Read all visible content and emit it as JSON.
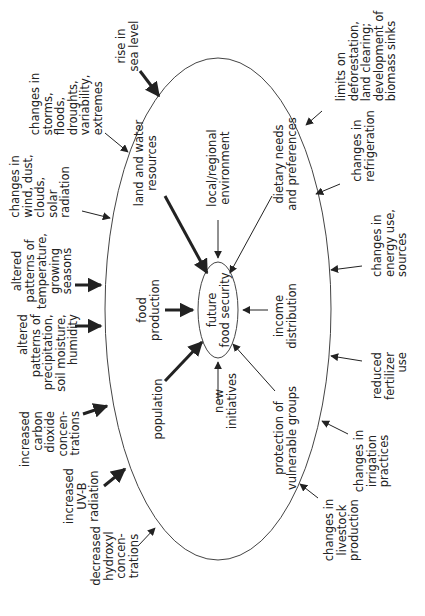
{
  "diagram": {
    "center": {
      "text": "future\nfood security"
    },
    "colors": {
      "line": "#333333",
      "text": "#222222",
      "background": "#ffffff"
    },
    "inner_factors": [
      {
        "id": "land-water",
        "text": "land and water\nresources",
        "arrow": "thick"
      },
      {
        "id": "local-env",
        "text": "local/regional\nenvironment",
        "arrow": "thin"
      },
      {
        "id": "dietary",
        "text": "dietary needs\nand preferences",
        "arrow": "thin"
      },
      {
        "id": "food-production",
        "text": "food\nproduction",
        "arrow": "thick"
      },
      {
        "id": "income",
        "text": "income\ndistribution",
        "arrow": "thin"
      },
      {
        "id": "population",
        "text": "population",
        "arrow": "thick"
      },
      {
        "id": "new-initiatives",
        "text": "new\ninitiatives",
        "arrow": "thin"
      },
      {
        "id": "vulnerable",
        "text": "protection of\nvulnerable groups",
        "arrow": "thin"
      }
    ],
    "outer_left": [
      {
        "id": "sea-level",
        "text": "rise in\nsea level",
        "arrow": "thick"
      },
      {
        "id": "storms",
        "text": "changes in\nstorms,\nfloods,\ndroughts,\nvariability,\nextremes",
        "arrow": "thin"
      },
      {
        "id": "wind",
        "text": "changes in\nwind, dust,\nclouds,\nsolar\nradiation",
        "arrow": "thin"
      },
      {
        "id": "temperature",
        "text": "altered\npatterns of\ntemperature,\ngrowing\nseasons",
        "arrow": "thick"
      },
      {
        "id": "precipitation",
        "text": "altered\npatterns of\nprecipitation,\nsoil moisture,\nhumidity",
        "arrow": "thick"
      },
      {
        "id": "co2",
        "text": "increased\ncarbon\ndioxide\nconcen-\ntrations",
        "arrow": "thick"
      },
      {
        "id": "uvb",
        "text": "increased\nUV-B\nradiation",
        "arrow": "thick"
      },
      {
        "id": "hydroxyl",
        "text": "decreased\nhydroxyl\nconcen-\ntrations",
        "arrow": "thin"
      }
    ],
    "outer_right": [
      {
        "id": "deforestation",
        "text": "limits on\ndeforestation,\nland clearing;\ndevelopment of\nbiomass sinks",
        "arrow": "thin"
      },
      {
        "id": "refrigeration",
        "text": "changes in\nrefrigeration",
        "arrow": "thin"
      },
      {
        "id": "energy",
        "text": "changes in\nenergy use,\nsources",
        "arrow": "thin"
      },
      {
        "id": "fertilizer",
        "text": "reduced\nfertilizer\nuse",
        "arrow": "thin"
      },
      {
        "id": "irrigation",
        "text": "changes in\nirrigation\npractices",
        "arrow": "thin"
      },
      {
        "id": "livestock",
        "text": "changes in\nlivestock\nproduction",
        "arrow": "thin"
      }
    ]
  }
}
